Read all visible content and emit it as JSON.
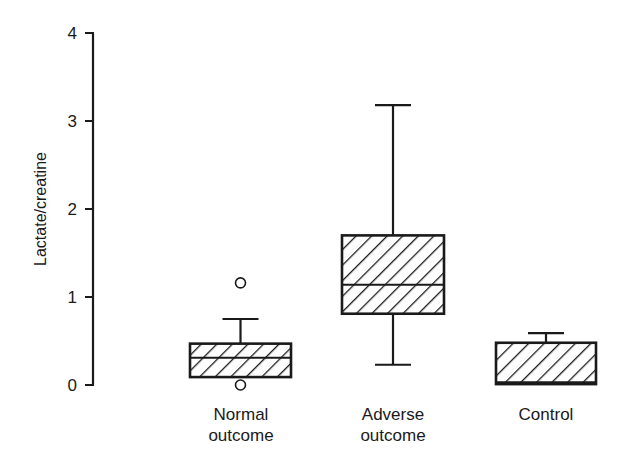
{
  "chart_data": {
    "type": "box",
    "title": "",
    "xlabel": "",
    "ylabel": "Lactate/creatine",
    "ylim": [
      0,
      4
    ],
    "yticks": [
      "0",
      "1",
      "2",
      "3",
      "4"
    ],
    "grid": false,
    "legend": null,
    "categories": [
      "Normal outcome",
      "Adverse outcome",
      "Control"
    ],
    "boxes": [
      {
        "name": "Normal outcome",
        "whisker_low": null,
        "q1": 0.09,
        "median": 0.31,
        "q3": 0.47,
        "whisker_high": 0.75,
        "outliers": [
          1.16,
          0.0
        ]
      },
      {
        "name": "Adverse outcome",
        "whisker_low": 0.23,
        "q1": 0.81,
        "median": 1.14,
        "q3": 1.7,
        "whisker_high": 3.18,
        "outliers": []
      },
      {
        "name": "Control",
        "whisker_low": null,
        "q1": 0.01,
        "median": 0.03,
        "q3": 0.48,
        "whisker_high": 0.59,
        "outliers": []
      }
    ]
  },
  "labels": {
    "ylabel": "Lactate/creatine",
    "cat0_line1": "Normal",
    "cat0_line2": "outcome",
    "cat1_line1": "Adverse",
    "cat1_line2": "outcome",
    "cat2_line1": "Control"
  }
}
